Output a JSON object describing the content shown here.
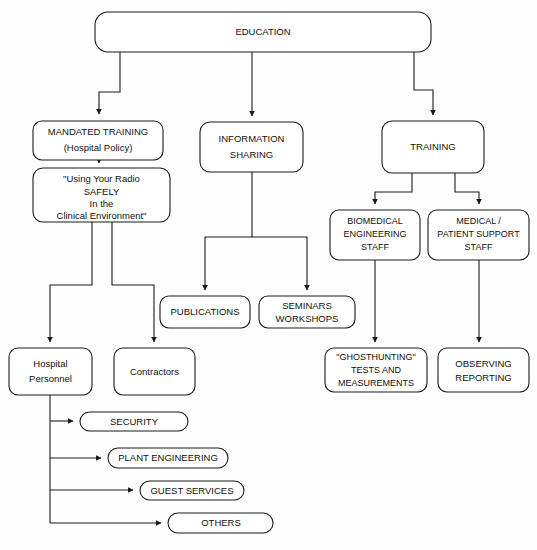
{
  "diagram": {
    "background_color": "#fdfdfd",
    "line_color": "#1a1a1a",
    "box_fill": "#ffffff",
    "nodes": {
      "education": {
        "label": "EDUCATION"
      },
      "mandated_training": {
        "line1": "MANDATED TRAINING",
        "line2": "(Hospital Policy)"
      },
      "using_radio": {
        "line1": "\"Using Your Radio",
        "line2": "SAFELY",
        "line3": "In the",
        "line4": "Clinical Environment\""
      },
      "information_sharing": {
        "line1": "INFORMATION",
        "line2": "SHARING"
      },
      "training": {
        "label": "TRAINING"
      },
      "publications": {
        "label": "PUBLICATIONS"
      },
      "seminars_workshops": {
        "line1": "SEMINARS",
        "line2": "WORKSHOPS"
      },
      "biomedical_engineering_staff": {
        "line1": "BIOMEDICAL",
        "line2": "ENGINEERING",
        "line3": "STAFF"
      },
      "medical_patient_support_staff": {
        "line1": "MEDICAL /",
        "line2": "PATIENT SUPPORT",
        "line3": "STAFF"
      },
      "hospital_personnel": {
        "line1": "Hospital",
        "line2": "Personnel"
      },
      "contractors": {
        "label": "Contractors"
      },
      "ghosthunting": {
        "line1": "\"GHOSTHUNTING\"",
        "line2": "TESTS AND",
        "line3": "MEASUREMENTS"
      },
      "observing_reporting": {
        "line1": "OBSERVING",
        "line2": "REPORTING"
      },
      "security": {
        "label": "SECURITY"
      },
      "plant_engineering": {
        "label": "PLANT ENGINEERING"
      },
      "guest_services": {
        "label": "GUEST SERVICES"
      },
      "others": {
        "label": "OTHERS"
      }
    }
  }
}
